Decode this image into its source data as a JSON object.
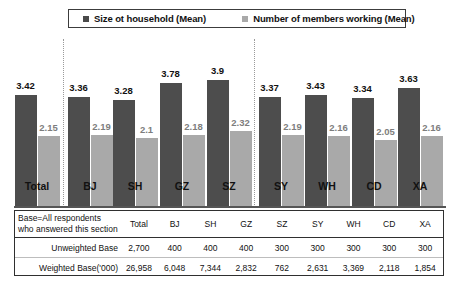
{
  "legend": {
    "entries": [
      {
        "label": "Size ot household (Mean)",
        "color": "#4a4a4a",
        "swatch": "dark"
      },
      {
        "label": "Number of members working (Mean)",
        "color": "#a9a9a9",
        "swatch": "light"
      }
    ]
  },
  "chart_data": {
    "type": "bar",
    "title": "",
    "xlabel": "",
    "ylabel": "",
    "ylim": [
      0,
      4.4
    ],
    "grid": false,
    "legend_position": "top",
    "categories": [
      "Total",
      "BJ",
      "SH",
      "GZ",
      "SZ",
      "SY",
      "WH",
      "CD",
      "XA"
    ],
    "series": [
      {
        "name": "Size ot household (Mean)",
        "color": "#4d4d4d",
        "values": [
          3.42,
          3.36,
          3.28,
          3.78,
          3.9,
          3.37,
          3.43,
          3.34,
          3.63
        ],
        "labels": [
          "3.42",
          "3.36",
          "3.28",
          "3.78",
          "3.9",
          "3.37",
          "3.43",
          "3.34",
          "3.63"
        ]
      },
      {
        "name": "Number of members working (Mean)",
        "color": "#a9a9a9",
        "values": [
          2.15,
          2.19,
          2.1,
          2.18,
          2.32,
          2.19,
          2.16,
          2.05,
          2.16
        ],
        "labels": [
          "2.15",
          "2.19",
          "2.1",
          "2.18",
          "2.32",
          "2.19",
          "2.16",
          "2.05",
          "2.16"
        ]
      }
    ],
    "dividers_after": [
      "Total",
      "SZ"
    ]
  },
  "table": {
    "header_label": "Base=All respondents who answered this section",
    "columns": [
      "Total",
      "BJ",
      "SH",
      "GZ",
      "SZ",
      "SY",
      "WH",
      "CD",
      "XA"
    ],
    "rows": [
      {
        "label": "Unweighted Base",
        "values": [
          "2,700",
          "400",
          "400",
          "400",
          "300",
          "300",
          "300",
          "300",
          "300"
        ]
      },
      {
        "label": "Weighted Base('000)",
        "values": [
          "26,958",
          "6,048",
          "7,344",
          "2,832",
          "762",
          "2,631",
          "3,369",
          "2,118",
          "1,854"
        ]
      }
    ]
  }
}
